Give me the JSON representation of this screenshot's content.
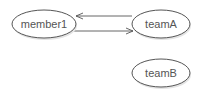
{
  "diagram": {
    "type": "directed-graph",
    "nodes": [
      {
        "id": "member1",
        "label": "member1"
      },
      {
        "id": "teamA",
        "label": "teamA"
      },
      {
        "id": "teamB",
        "label": "teamB"
      }
    ],
    "edges": [
      {
        "from": "teamA",
        "to": "member1"
      },
      {
        "from": "member1",
        "to": "teamA"
      }
    ],
    "colors": {
      "stroke": "#555555",
      "fill": "#ffffff",
      "text": "#555555"
    }
  }
}
